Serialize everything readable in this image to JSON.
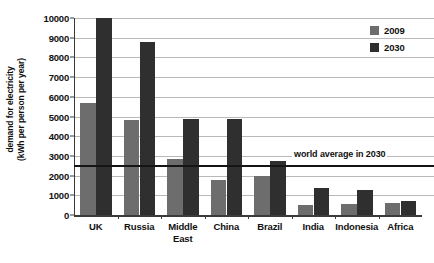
{
  "chart_data": {
    "type": "bar",
    "title": "",
    "xlabel": "",
    "ylabel_line1": "demand for electricity",
    "ylabel_line2": "(kWh per person per year)",
    "ylim": [
      0,
      10000
    ],
    "ytick_step": 1000,
    "yticks": [
      "0",
      "1000",
      "2000",
      "3000",
      "4000",
      "5000",
      "6000",
      "7000",
      "8000",
      "9000",
      "10000"
    ],
    "grid": true,
    "legend_position": "top-right",
    "categories": [
      "UK",
      "Russia",
      "Middle East",
      "China",
      "Brazil",
      "India",
      "Indonesia",
      "Africa"
    ],
    "category_lines": [
      [
        "UK"
      ],
      [
        "Russia"
      ],
      [
        "Middle",
        "East"
      ],
      [
        "China"
      ],
      [
        "Brazil"
      ],
      [
        "India"
      ],
      [
        "Indonesia"
      ],
      [
        "Africa"
      ]
    ],
    "series": [
      {
        "name": "2009",
        "color": "#6d6d6d",
        "values": [
          5700,
          4800,
          2850,
          1800,
          2000,
          500,
          550,
          600
        ]
      },
      {
        "name": "2030",
        "color": "#2f2f2f",
        "values": [
          10000,
          8800,
          4850,
          4850,
          2750,
          1350,
          1250,
          700
        ]
      }
    ],
    "annotations": [
      {
        "label": "world average in 2030",
        "value": 2550,
        "type": "horizontal-line",
        "color": "#151515"
      }
    ]
  },
  "legend": {
    "items": [
      {
        "label": "2009"
      },
      {
        "label": "2030"
      }
    ]
  }
}
